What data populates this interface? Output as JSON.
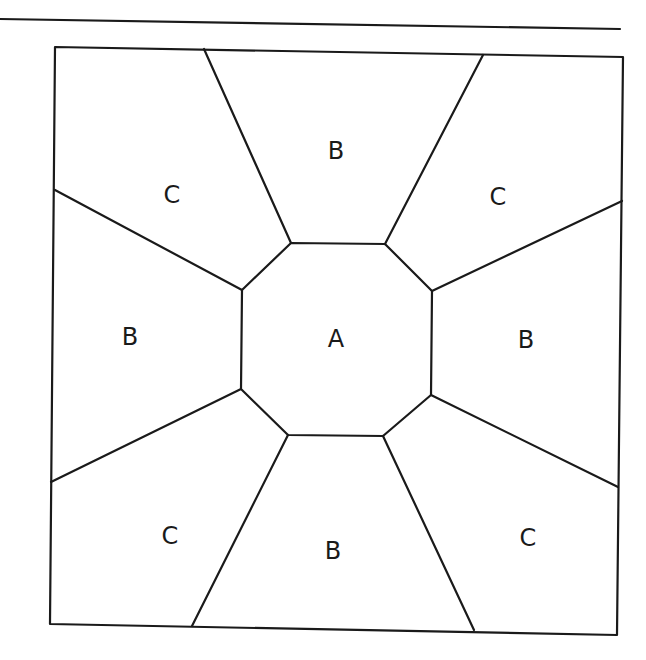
{
  "diagram": {
    "stroke_color": "#1a1a1a",
    "background": "#ffffff",
    "labels": {
      "center": "A",
      "top": "B",
      "left": "B",
      "right": "B",
      "bottom": "B",
      "top_left": "C",
      "top_right": "C",
      "bottom_left": "C",
      "bottom_right": "C"
    }
  }
}
